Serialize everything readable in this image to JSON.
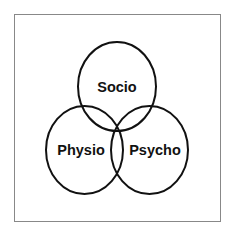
{
  "diagram": {
    "type": "venn",
    "colors": {
      "stroke": "#111111",
      "frame": "#888888",
      "background": "#ffffff"
    },
    "sets": [
      {
        "id": "socio",
        "label": "Socio",
        "position": "top"
      },
      {
        "id": "physio",
        "label": "Physio",
        "position": "bottom-left"
      },
      {
        "id": "psycho",
        "label": "Psycho",
        "position": "bottom-right"
      }
    ]
  }
}
